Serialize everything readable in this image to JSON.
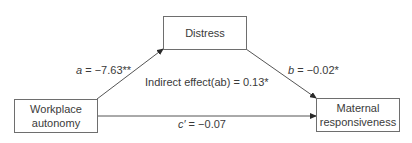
{
  "nodes": {
    "predictor": {
      "line1": "Workplace",
      "line2": "autonomy"
    },
    "mediator": {
      "label": "Distress"
    },
    "outcome": {
      "line1": "Maternal",
      "line2": "responsiveness"
    }
  },
  "paths": {
    "a": {
      "symbol": "a",
      "value": " = −7.63**"
    },
    "b": {
      "symbol": "b",
      "value": " = −0.02*"
    },
    "c_prime": {
      "symbol": "c′",
      "value": " = −0.07"
    },
    "indirect": {
      "label": "Indirect effect(ab) = 0.13*"
    }
  }
}
